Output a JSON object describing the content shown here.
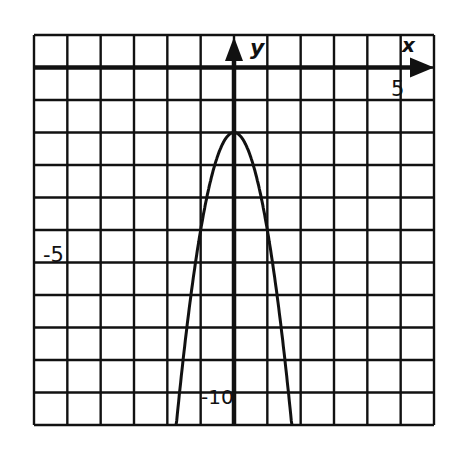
{
  "chart_data": {
    "type": "line",
    "title": "",
    "xlabel": "x",
    "ylabel": "y",
    "xlim": [
      -6,
      6
    ],
    "ylim": [
      -11,
      1
    ],
    "grid": true,
    "grid_step": 1,
    "tick_labels": {
      "x": [
        {
          "value": -5,
          "label": "-5"
        },
        {
          "value": 5,
          "label": "5"
        }
      ],
      "y": [
        {
          "value": -10,
          "label": "-10"
        }
      ]
    },
    "series": [
      {
        "name": "parabola",
        "equation": "y = -3x^2 - 2",
        "vertex": [
          0,
          -2
        ],
        "x": [
          -1.73,
          -1.5,
          -1.25,
          -1,
          -0.75,
          -0.5,
          -0.25,
          0,
          0.25,
          0.5,
          0.75,
          1,
          1.25,
          1.5,
          1.73
        ],
        "y": [
          -11,
          -8.75,
          -6.69,
          -5,
          -3.69,
          -2.75,
          -2.19,
          -2,
          -2.19,
          -2.75,
          -3.69,
          -5,
          -6.69,
          -8.75,
          -11
        ]
      }
    ],
    "legend": null
  },
  "labels": {
    "x_axis": "x",
    "y_axis": "y",
    "x_tick_pos": "5",
    "x_tick_neg": "-5",
    "y_tick_neg": "-10"
  },
  "colors": {
    "ink": "#111111",
    "background": "#ffffff"
  }
}
